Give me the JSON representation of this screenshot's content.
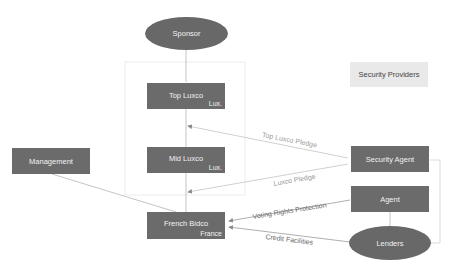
{
  "diagram": {
    "nodes": {
      "sponsor": {
        "label": "Sponsor",
        "shape": "ellipse"
      },
      "top_luxco": {
        "label": "Top Luxco",
        "jurisdiction": "Lux."
      },
      "mid_luxco": {
        "label": "Mid Luxco",
        "jurisdiction": "Lux."
      },
      "french_bidco": {
        "label": "French Bidco",
        "jurisdiction": "France"
      },
      "management": {
        "label": "Management"
      },
      "security_agent": {
        "label": "Security Agent"
      },
      "agent": {
        "label": "Agent"
      },
      "lenders": {
        "label": "Lenders",
        "shape": "ellipse"
      }
    },
    "legend": {
      "label": "Security Providers"
    },
    "edges": [
      {
        "from": "sponsor",
        "to": "top_luxco",
        "label": ""
      },
      {
        "from": "top_luxco",
        "to": "mid_luxco",
        "label": ""
      },
      {
        "from": "mid_luxco",
        "to": "french_bidco",
        "label": ""
      },
      {
        "from": "management",
        "to": "french_bidco",
        "label": ""
      },
      {
        "from": "security_agent",
        "to": "top_luxco",
        "label": "Top Luxco Pledge"
      },
      {
        "from": "security_agent",
        "to": "mid_luxco",
        "label": "Luxco Pledge"
      },
      {
        "from": "agent",
        "to": "french_bidco",
        "label": "Voting Rights Protection"
      },
      {
        "from": "lenders",
        "to": "french_bidco",
        "label": "Credit Facilities"
      },
      {
        "from": "agent",
        "to": "lenders",
        "label": ""
      },
      {
        "from": "security_agent",
        "to": "lenders",
        "label": ""
      }
    ],
    "colors": {
      "node_fill": "#6b6b6b",
      "node_text": "#f2f2f2",
      "legend_fill": "#e9e9e9",
      "edge": "#b0b0b0"
    }
  }
}
